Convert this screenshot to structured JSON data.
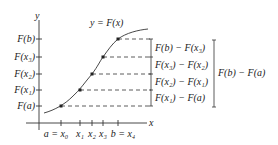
{
  "diagram": {
    "curve_label": "y = F(x)",
    "axes": {
      "x_label": "x",
      "y_label": "y"
    },
    "y_ticks": [
      {
        "label": "F(a)",
        "y": 106
      },
      {
        "label": "F(x₁)",
        "y": 90
      },
      {
        "label": "F(x₂)",
        "y": 74
      },
      {
        "label": "F(x₃)",
        "y": 57
      },
      {
        "label": "F(b)",
        "y": 39
      }
    ],
    "x_ticks": [
      {
        "label": "a = x₀",
        "x": 61
      },
      {
        "label": "x₁",
        "x": 80
      },
      {
        "label": "x₂",
        "x": 92
      },
      {
        "label": "x₃",
        "x": 103
      },
      {
        "label": "b = x₄",
        "x": 118
      }
    ],
    "differences": [
      "F(b) − F(x₃)",
      "F(x₃) − F(x₂)",
      "F(x₂) − F(x₁)",
      "F(x₁) − F(a)"
    ],
    "total_difference": "F(b) − F(a)"
  }
}
